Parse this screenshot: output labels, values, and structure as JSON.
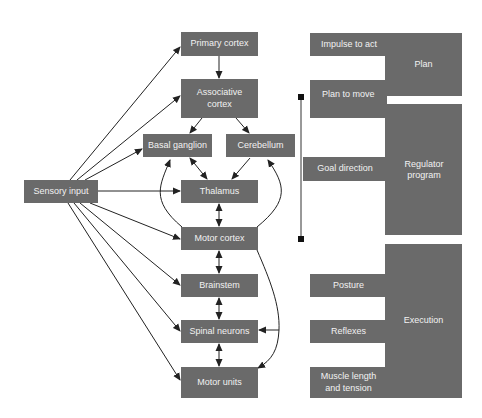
{
  "left_diagram": {
    "nodes": {
      "sensory_input": "Sensory input",
      "primary_cortex": "Primary cortex",
      "associative_cortex": "Associative cortex",
      "basal_ganglion": "Basal ganglion",
      "cerebellum": "Cerebellum",
      "thalamus": "Thalamus",
      "motor_cortex": "Motor cortex",
      "brainstem": "Brainstem",
      "spinal_neurons": "Spinal neurons",
      "motor_units": "Motor units"
    },
    "edges": [
      {
        "from": "Sensory input",
        "to": "Primary cortex",
        "type": "arrow"
      },
      {
        "from": "Sensory input",
        "to": "Associative cortex",
        "type": "arrow"
      },
      {
        "from": "Sensory input",
        "to": "Basal ganglion",
        "type": "arrow"
      },
      {
        "from": "Sensory input",
        "to": "Thalamus",
        "type": "arrow"
      },
      {
        "from": "Sensory input",
        "to": "Motor cortex",
        "type": "arrow"
      },
      {
        "from": "Sensory input",
        "to": "Brainstem",
        "type": "arrow"
      },
      {
        "from": "Sensory input",
        "to": "Spinal neurons",
        "type": "arrow"
      },
      {
        "from": "Sensory input",
        "to": "Motor units",
        "type": "arrow"
      },
      {
        "from": "Primary cortex",
        "to": "Associative cortex",
        "type": "arrow"
      },
      {
        "from": "Associative cortex",
        "to": "Basal ganglion",
        "type": "arrow"
      },
      {
        "from": "Associative cortex",
        "to": "Cerebellum",
        "type": "arrow"
      },
      {
        "from": "Basal ganglion",
        "to": "Thalamus",
        "type": "bidirectional"
      },
      {
        "from": "Cerebellum",
        "to": "Thalamus",
        "type": "arrow"
      },
      {
        "from": "Thalamus",
        "to": "Motor cortex",
        "type": "bidirectional"
      },
      {
        "from": "Motor cortex",
        "to": "Basal ganglion",
        "type": "curved-arrow"
      },
      {
        "from": "Motor cortex",
        "to": "Cerebellum",
        "type": "curved-arrow"
      },
      {
        "from": "Motor cortex",
        "to": "Brainstem",
        "type": "bidirectional"
      },
      {
        "from": "Brainstem",
        "to": "Spinal neurons",
        "type": "bidirectional"
      },
      {
        "from": "Spinal neurons",
        "to": "Motor units",
        "type": "bidirectional"
      },
      {
        "from": "Motor cortex",
        "to": "Spinal neurons",
        "type": "curved-arrow"
      },
      {
        "from": "Motor cortex",
        "to": "Motor units",
        "type": "curved-arrow"
      }
    ]
  },
  "right_diagram": {
    "plan": {
      "label": "Plan",
      "items": [
        "Impulse to act",
        "Plan to move"
      ]
    },
    "regulator": {
      "label": "Regulator program",
      "items": [
        "Goal direction"
      ]
    },
    "execution": {
      "label": "Execution",
      "items": [
        "Posture",
        "Reflexes",
        "Muscle length and tension"
      ]
    }
  },
  "colors": {
    "box": "#6a6a6a",
    "text": "#f2f2f2",
    "line": "#222222"
  }
}
